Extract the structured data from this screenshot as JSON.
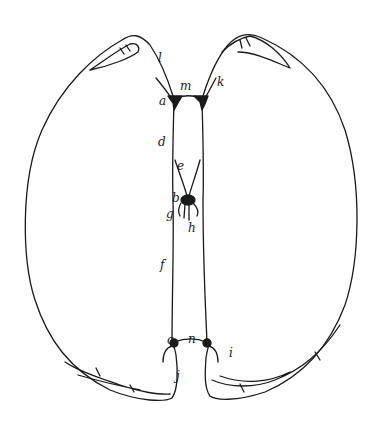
{
  "diagram": {
    "stroke_color": "#1a1a1a",
    "background": "#ffffff",
    "labels": [
      {
        "id": "l",
        "text": "l",
        "x": 158,
        "y": 58
      },
      {
        "id": "m",
        "text": "m",
        "x": 181,
        "y": 85
      },
      {
        "id": "k",
        "text": "k",
        "x": 217,
        "y": 81
      },
      {
        "id": "a",
        "text": "a",
        "x": 160,
        "y": 100
      },
      {
        "id": "d",
        "text": "d",
        "x": 159,
        "y": 141
      },
      {
        "id": "e",
        "text": "e",
        "x": 177,
        "y": 165
      },
      {
        "id": "b",
        "text": "b",
        "x": 173,
        "y": 197
      },
      {
        "id": "g",
        "text": "g",
        "x": 167,
        "y": 213
      },
      {
        "id": "h",
        "text": "h",
        "x": 188,
        "y": 227
      },
      {
        "id": "f",
        "text": "f",
        "x": 161,
        "y": 265
      },
      {
        "id": "c",
        "text": "c",
        "x": 168,
        "y": 344
      },
      {
        "id": "n",
        "text": "n",
        "x": 189,
        "y": 341
      },
      {
        "id": "i",
        "text": "i",
        "x": 230,
        "y": 352
      },
      {
        "id": "j",
        "text": "j",
        "x": 176,
        "y": 375
      }
    ]
  }
}
